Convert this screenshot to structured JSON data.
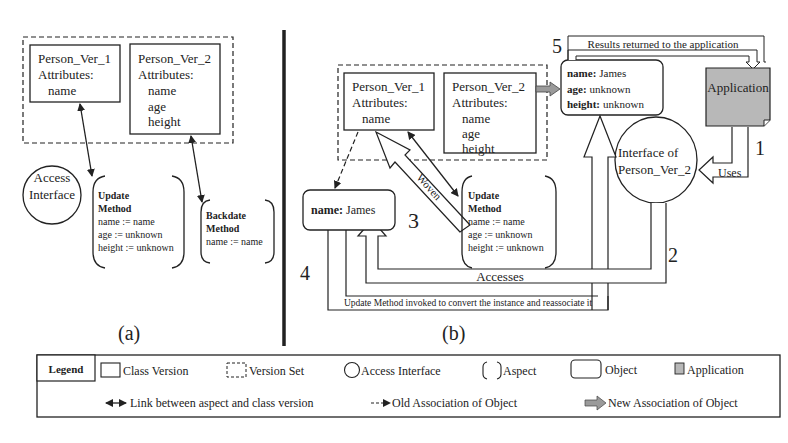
{
  "panel_a": {
    "label": "(a)",
    "class_v1": {
      "title": "Person_Ver_1",
      "attr_label": "Attributes:",
      "attrs": [
        "name"
      ]
    },
    "class_v2": {
      "title": "Person_Ver_2",
      "attr_label": "Attributes:",
      "attrs": [
        "name",
        "age",
        "height"
      ]
    },
    "access_interface": {
      "line1": "Access",
      "line2": "Interface"
    },
    "update_aspect": {
      "title1": "Update",
      "title2": "Method",
      "lines": [
        "name := name",
        "age := unknown",
        "height := unknown"
      ]
    },
    "backdate_aspect": {
      "title1": "Backdate",
      "title2": "Method",
      "lines": [
        "name := name"
      ]
    }
  },
  "panel_b": {
    "label": "(b)",
    "class_v1": {
      "title": "Person_Ver_1",
      "attr_label": "Attributes:",
      "attrs": [
        "name"
      ]
    },
    "class_v2": {
      "title": "Person_Ver_2",
      "attr_label": "Attributes:",
      "attrs": [
        "name",
        "age",
        "height"
      ]
    },
    "new_object": {
      "rows": [
        {
          "key": "name:",
          "value": "James"
        },
        {
          "key": "age:",
          "value": "unknown"
        },
        {
          "key": "height:",
          "value": "unknown"
        }
      ]
    },
    "old_object": {
      "key": "name:",
      "value": "James"
    },
    "application": {
      "label": "Application"
    },
    "interface": {
      "line1": "Interface of",
      "line2": "Person_Ver_2"
    },
    "update_aspect": {
      "title1": "Update",
      "title2": "Method",
      "lines": [
        "name := name",
        "age := unknown",
        "height := unknown"
      ]
    },
    "arrows": {
      "uses": "Uses",
      "woven": "Woven",
      "accesses": "Accesses",
      "update_invoked": "Update Method invoked to convert the instance and reassociate it",
      "results": "Results returned to the application"
    },
    "steps": [
      "1",
      "2",
      "3",
      "4",
      "5"
    ]
  },
  "legend": {
    "title": "Legend",
    "items": [
      {
        "icon": "class-version-icon",
        "label": "Class Version"
      },
      {
        "icon": "version-set-icon",
        "label": "Version Set"
      },
      {
        "icon": "access-interface-icon",
        "label": "Access Interface"
      },
      {
        "icon": "aspect-icon",
        "label": "Aspect"
      },
      {
        "icon": "object-icon",
        "label": "Object"
      },
      {
        "icon": "application-icon",
        "label": "Application"
      },
      {
        "icon": "double-arrow-icon",
        "label": "Link between aspect and class version"
      },
      {
        "icon": "dashed-arrow-icon",
        "label": "Old Association of Object"
      },
      {
        "icon": "grey-arrow-icon",
        "label": "New Association of Object"
      }
    ]
  },
  "colors": {
    "application_fill": "#b8b8b8",
    "new_assoc_arrow": "#9a9a9a",
    "line": "#222222"
  }
}
